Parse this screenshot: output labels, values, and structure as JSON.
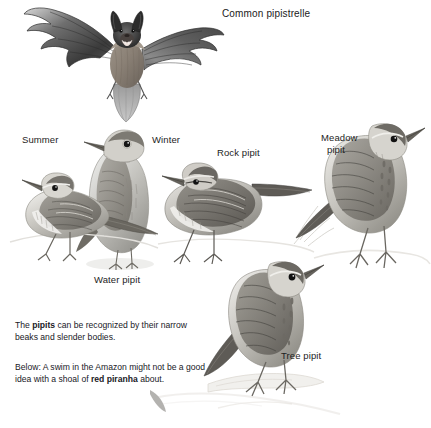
{
  "page": {
    "width": 431,
    "height": 428,
    "background": "#ffffff",
    "ink": "#1d1d1d"
  },
  "headings": {
    "bat_title": "Common pipistrelle"
  },
  "labels": [
    {
      "id": "summer",
      "text": "Summer",
      "x": 22,
      "y": 134
    },
    {
      "id": "winter",
      "text": "Winter",
      "x": 152,
      "y": 134
    },
    {
      "id": "rock_pipit",
      "text": "Rock pipit",
      "x": 217,
      "y": 147
    },
    {
      "id": "meadow_line1",
      "text": "Meadow",
      "x": 321,
      "y": 132
    },
    {
      "id": "meadow_line2",
      "text": "pipit",
      "x": 327,
      "y": 144
    },
    {
      "id": "water_pipit",
      "text": "Water pipit",
      "x": 94,
      "y": 274
    },
    {
      "id": "tree_pipit",
      "text": "Tree pipit",
      "x": 281,
      "y": 350
    }
  ],
  "captions": [
    {
      "id": "pipits-caption",
      "x": 15,
      "y": 320,
      "runs": [
        {
          "text": "The ",
          "bold": false
        },
        {
          "text": "pipits",
          "bold": true
        },
        {
          "text": " can be recognized by their narrow beaks and slender bodies.",
          "bold": false
        }
      ]
    },
    {
      "id": "piranha-caption",
      "x": 15,
      "y": 362,
      "runs": [
        {
          "text": "Below: A swim in the Amazon might not be a good idea with a shoal of ",
          "bold": false
        },
        {
          "text": "red piranha",
          "bold": true
        },
        {
          "text": " about.",
          "bold": false
        }
      ]
    }
  ],
  "illustrations": [
    {
      "id": "common-pipistrelle-bat",
      "name": "bat-illustration",
      "subject": "Common pipistrelle bat in flight, wings spread"
    },
    {
      "id": "water-pipit-summer",
      "name": "water-pipit-summer-illustration",
      "subject": "Water pipit in summer plumage, perched, side view"
    },
    {
      "id": "water-pipit-winter",
      "name": "water-pipit-winter-illustration",
      "subject": "Water pipit in winter plumage, upright, three-quarter view"
    },
    {
      "id": "rock-pipit",
      "name": "rock-pipit-illustration",
      "subject": "Rock pipit standing, side view"
    },
    {
      "id": "meadow-pipit",
      "name": "meadow-pipit-illustration",
      "subject": "Meadow pipit standing on tussock, side view"
    },
    {
      "id": "tree-pipit",
      "name": "tree-pipit-illustration",
      "subject": "Tree pipit perched on branch, side view"
    }
  ]
}
